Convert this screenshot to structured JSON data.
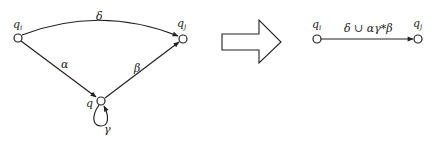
{
  "diagram": {
    "left": {
      "nodes": [
        {
          "id": "qi",
          "label": "q",
          "subscript": "i",
          "x": 18,
          "y": 38
        },
        {
          "id": "qj",
          "label": "q",
          "subscript": "j",
          "x": 183,
          "y": 39
        },
        {
          "id": "q",
          "label": "q",
          "subscript": "",
          "x": 101,
          "y": 101
        }
      ],
      "edges": [
        {
          "from": "qi",
          "to": "qj",
          "label": "δ"
        },
        {
          "from": "qi",
          "to": "q",
          "label": "α"
        },
        {
          "from": "q",
          "to": "qj",
          "label": "β"
        },
        {
          "from": "q",
          "to": "q",
          "label": "γ",
          "self_loop": true
        }
      ]
    },
    "transform_arrow": {
      "direction": "right"
    },
    "right": {
      "nodes": [
        {
          "id": "qi",
          "label": "q",
          "subscript": "i",
          "x": 317,
          "y": 39
        },
        {
          "id": "qj",
          "label": "q",
          "subscript": "j",
          "x": 418,
          "y": 39
        }
      ],
      "edges": [
        {
          "from": "qi",
          "to": "qj",
          "label": "δ ∪ αγ*β"
        }
      ]
    }
  },
  "colors": {
    "stroke": "#222222",
    "background": "#ffffff"
  }
}
